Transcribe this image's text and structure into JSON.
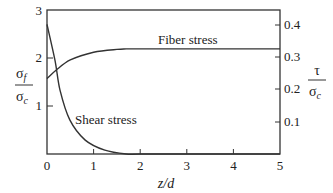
{
  "chart_data": {
    "type": "line",
    "title": "",
    "xlabel": "z/d",
    "ylabel_left": "σf / σc",
    "ylabel_right": "τ / σc",
    "xlim": [
      0,
      5
    ],
    "ylim_left": [
      0,
      3
    ],
    "ylim_right": [
      0,
      0.446
    ],
    "x_ticks": [
      "0",
      "1",
      "2",
      "3",
      "4",
      "5"
    ],
    "y_left_ticks": [
      "1",
      "2",
      "3"
    ],
    "y_right_ticks": [
      "0.1",
      "0.2",
      "0.3",
      "0.4"
    ],
    "grid": false,
    "legend": "inline labels",
    "series": [
      {
        "name": "Fiber stress",
        "axis": "left",
        "x": [
          0,
          0.2,
          0.5,
          1.0,
          1.5,
          1.7,
          2,
          3,
          4,
          5
        ],
        "values": [
          1.57,
          1.75,
          1.96,
          2.12,
          2.18,
          2.19,
          2.19,
          2.19,
          2.19,
          2.19
        ]
      },
      {
        "name": "Shear stress",
        "axis": "left-scaled (read on right axis as τ/σc)",
        "x": [
          0,
          0.17,
          0.28,
          0.49,
          0.82,
          1.24,
          1.7,
          2,
          3,
          4,
          5
        ],
        "values": [
          2.7,
          1.96,
          1.33,
          0.71,
          0.29,
          0.08,
          0.0,
          0.0,
          0.0,
          0.0,
          0.0
        ],
        "values_right_axis": [
          0.4,
          0.29,
          0.2,
          0.106,
          0.043,
          0.012,
          0.0,
          0.0,
          0.0,
          0.0,
          0.0
        ]
      }
    ],
    "annotations": [
      "Fiber stress",
      "Shear stress"
    ]
  },
  "labels": {
    "fiber": "Fiber stress",
    "shear": "Shear stress",
    "xlabel": "z/d",
    "left_num": "σ",
    "left_num_sub": "f",
    "left_den": "σ",
    "left_den_sub": "c",
    "right_num": "τ",
    "right_den": "σ",
    "right_den_sub": "c"
  },
  "ticks": {
    "x": [
      "0",
      "1",
      "2",
      "3",
      "4",
      "5"
    ],
    "yl": [
      "1",
      "2",
      "3"
    ],
    "yr": [
      "0.1",
      "0.2",
      "0.3",
      "0.4"
    ]
  }
}
